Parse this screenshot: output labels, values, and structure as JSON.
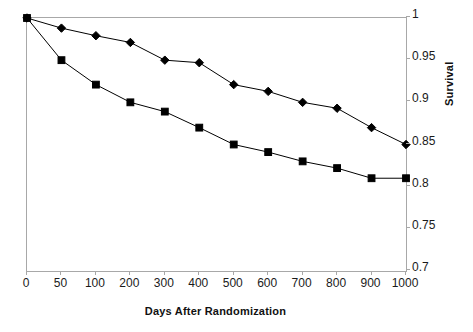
{
  "chart_data": {
    "type": "line",
    "title": "",
    "xlabel": "Days After Randomization",
    "ylabel": "Survival",
    "x": [
      0,
      50,
      100,
      200,
      300,
      400,
      500,
      600,
      700,
      800,
      900,
      1000
    ],
    "xtick_labels": [
      "0",
      "50",
      "100",
      "200",
      "300",
      "400",
      "500",
      "600",
      "700",
      "800",
      "900",
      "1000"
    ],
    "x_axis_scale": "categorical",
    "ytick_labels": [
      "1",
      "0.95",
      "0.9",
      "0.85",
      "0.8",
      "0.75",
      "0.7"
    ],
    "ytick_values": [
      1,
      0.95,
      0.9,
      0.85,
      0.8,
      0.75,
      0.7
    ],
    "ylim": [
      0.7,
      1.0
    ],
    "y_axis_position": "right",
    "grid": false,
    "legend": "none",
    "series": [
      {
        "name": "Upper curve",
        "marker": "diamond",
        "color": "#000000",
        "values": [
          1.0,
          0.988,
          0.979,
          0.971,
          0.95,
          0.947,
          0.921,
          0.913,
          0.9,
          0.893,
          0.87,
          0.85
        ]
      },
      {
        "name": "Lower curve",
        "marker": "square",
        "color": "#000000",
        "values": [
          1.0,
          0.95,
          0.921,
          0.9,
          0.889,
          0.87,
          0.85,
          0.841,
          0.83,
          0.822,
          0.81,
          0.81
        ]
      }
    ]
  }
}
